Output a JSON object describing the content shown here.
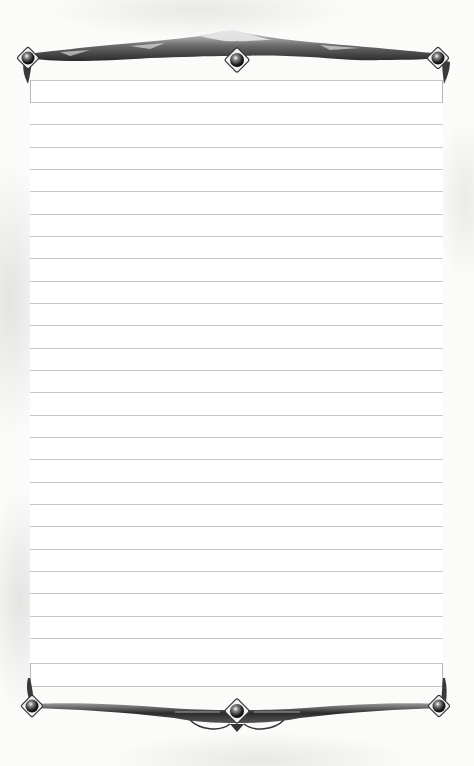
{
  "page": {
    "type": "ruled-journal-page",
    "background_color": "#fbfbfa",
    "paper_color": "#ffffff",
    "rule_color": "#c6c6c6",
    "ornament_color": "#3a3a3a"
  },
  "header_box": {
    "top": 80,
    "bottom": 102
  },
  "footer_box": {
    "top": 663,
    "bottom": 686
  },
  "rules": [
    124,
    147,
    169,
    191,
    214,
    236,
    258,
    281,
    303,
    325,
    348,
    370,
    392,
    415,
    437,
    459,
    482,
    504,
    526,
    549,
    571,
    593,
    616,
    638
  ],
  "ornaments": {
    "top": {
      "gems": [
        "left-gem",
        "center-gem",
        "right-gem"
      ],
      "motif": "mountain-ridge"
    },
    "bottom": {
      "gems": [
        "left-gem",
        "center-gem",
        "right-gem"
      ],
      "motif": "engraved-scrollwork"
    }
  }
}
